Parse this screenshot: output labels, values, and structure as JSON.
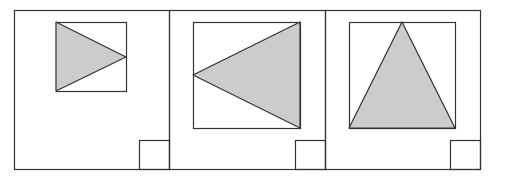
{
  "diagram": {
    "colors": {
      "stroke": "#333333",
      "fill": "#cccccc",
      "background": "#ffffff"
    },
    "panels": [
      {
        "id": "panel-1",
        "frame": {
          "x": 14,
          "y": 10,
          "w": 155,
          "h": 159
        },
        "inner_square": {
          "x": 56,
          "y": 22,
          "w": 70,
          "h": 69
        },
        "triangle": "56,22 126,57 56,91",
        "corner_square": {
          "x": 139,
          "y": 140,
          "w": 30,
          "h": 29
        },
        "orientation": "right-pointing"
      },
      {
        "id": "panel-2",
        "frame": {
          "x": 169,
          "y": 10,
          "w": 156,
          "h": 159
        },
        "inner_square": {
          "x": 193,
          "y": 22,
          "w": 107,
          "h": 106
        },
        "triangle": "300,22 193,75 300,128",
        "corner_square": {
          "x": 295,
          "y": 140,
          "w": 30,
          "h": 29
        },
        "orientation": "left-pointing"
      },
      {
        "id": "panel-3",
        "frame": {
          "x": 325,
          "y": 10,
          "w": 155,
          "h": 159
        },
        "inner_square": {
          "x": 349,
          "y": 22,
          "w": 106,
          "h": 106
        },
        "triangle": "402,22 349,128 455,128",
        "corner_square": {
          "x": 450,
          "y": 140,
          "w": 30,
          "h": 29
        },
        "orientation": "up-pointing"
      }
    ]
  }
}
